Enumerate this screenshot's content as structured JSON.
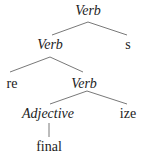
{
  "tree": {
    "root": {
      "label": "Verb",
      "italic": true
    },
    "level1": {
      "left": {
        "label": "Verb",
        "italic": true
      },
      "right": {
        "label": "s",
        "italic": false
      }
    },
    "level2": {
      "left": {
        "label": "re",
        "italic": false
      },
      "right": {
        "label": "Verb",
        "italic": true
      }
    },
    "level3": {
      "left": {
        "label": "Adjective",
        "italic": true
      },
      "right": {
        "label": "ize",
        "italic": false
      }
    },
    "level4": {
      "label": "final",
      "italic": false
    }
  },
  "colors": {
    "line": "#555555",
    "text": "#222222"
  }
}
